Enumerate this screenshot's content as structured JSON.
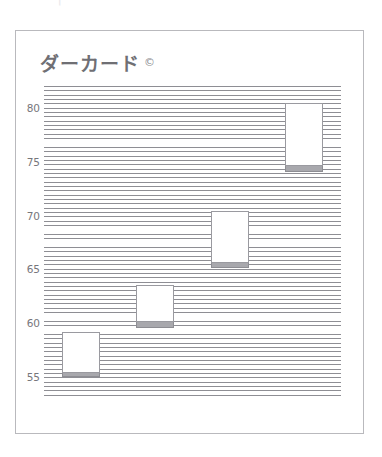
{
  "top_strip": {
    "ghost_text": "···|··"
  },
  "card": {
    "title": "ダーカード",
    "title_mark": "©"
  },
  "chart_data": {
    "type": "bar",
    "subtitle": "",
    "xlabel": "",
    "ylabel": "",
    "grid": true,
    "legend": null,
    "ylim": [
      53,
      82
    ],
    "yticks": [
      55,
      60,
      65,
      70,
      75,
      80
    ],
    "ytick_labels": [
      "55",
      "60",
      "65",
      "70",
      "75",
      "80"
    ],
    "categories": [
      "1",
      "2",
      "3",
      "4"
    ],
    "series": [
      {
        "name": "box",
        "top_values": [
          59.2,
          63.6,
          70.4,
          80.4
        ],
        "bottom_values": [
          55.4,
          60.1,
          65.6,
          74.6
        ],
        "values": [
          3.8,
          3.5,
          4.8,
          5.8
        ]
      },
      {
        "name": "base",
        "top_values": [
          55.4,
          60.1,
          65.6,
          74.6
        ],
        "bottom_values": [
          55.0,
          59.6,
          65.1,
          74.0
        ],
        "values": [
          0.4,
          0.5,
          0.5,
          0.6
        ]
      }
    ],
    "colors": {
      "box_fill": "#ffffff",
      "box_border": "#9a9aa0",
      "base_fill": "#a8a8ad",
      "hatch_line": "#8e8e94",
      "axis_text": "#76767b",
      "title_text": "#6f6f74",
      "card_border": "#b9b9bd",
      "background": "#ffffff"
    }
  }
}
